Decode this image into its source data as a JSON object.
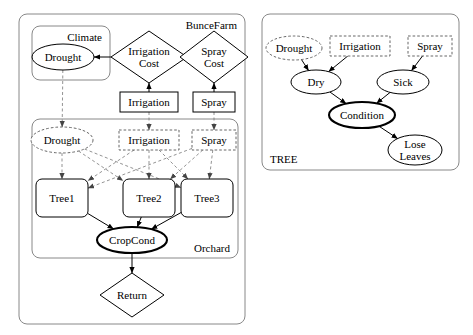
{
  "diagram": {
    "type": "object-oriented-bayesian-network",
    "panels": [
      {
        "id": "buncefarm",
        "label": "BunceFarm",
        "label_position": "top-right",
        "box": {
          "x": 19,
          "y": 14,
          "w": 226,
          "h": 310,
          "style": "solid-rounded"
        }
      },
      {
        "id": "tree-class",
        "label": "TREE",
        "label_position": "bottom-left",
        "box": {
          "x": 262,
          "y": 14,
          "w": 197,
          "h": 156,
          "style": "solid-rounded"
        }
      },
      {
        "id": "climate",
        "label": "Climate",
        "label_position": "top-right",
        "box": {
          "x": 32,
          "y": 26,
          "w": 78,
          "h": 54,
          "style": "solid-rounded"
        }
      },
      {
        "id": "orchard",
        "label": "Orchard",
        "label_position": "bottom-right",
        "box": {
          "x": 32,
          "y": 119,
          "w": 206,
          "h": 139,
          "style": "solid-rounded"
        }
      }
    ],
    "nodes": [
      {
        "id": "climate-drought",
        "label": "Drought",
        "shape": "ellipse",
        "border": "solid",
        "thick": false,
        "cx": 63,
        "cy": 57,
        "rx": 31,
        "ry": 13
      },
      {
        "id": "irrigation-cost",
        "label": "Irrigation\nCost",
        "shape": "diamond",
        "border": "solid",
        "thick": false,
        "cx": 149,
        "cy": 57,
        "rx": 38,
        "ry": 26
      },
      {
        "id": "spray-cost",
        "label": "Spray\nCost",
        "shape": "diamond",
        "border": "solid",
        "thick": false,
        "cx": 214,
        "cy": 57,
        "rx": 34,
        "ry": 26
      },
      {
        "id": "irrigation-box",
        "label": "Irrigation",
        "shape": "rect",
        "border": "solid",
        "thick": false,
        "cx": 149,
        "cy": 102,
        "rx": 29,
        "ry": 10
      },
      {
        "id": "spray-box",
        "label": "Spray",
        "shape": "rect",
        "border": "solid",
        "thick": false,
        "cx": 214,
        "cy": 102,
        "rx": 21,
        "ry": 10
      },
      {
        "id": "orchard-drought",
        "label": "Drought",
        "shape": "ellipse",
        "border": "dashed",
        "thick": false,
        "cx": 62,
        "cy": 140,
        "rx": 31,
        "ry": 13
      },
      {
        "id": "orchard-irrigation",
        "label": "Irrigation",
        "shape": "rect",
        "border": "dashed",
        "thick": false,
        "cx": 149,
        "cy": 140,
        "rx": 30,
        "ry": 10
      },
      {
        "id": "orchard-spray",
        "label": "Spray",
        "shape": "rect",
        "border": "dashed",
        "thick": false,
        "cx": 214,
        "cy": 140,
        "rx": 22,
        "ry": 10
      },
      {
        "id": "tree1",
        "label": "Tree1",
        "shape": "roundrect",
        "border": "solid",
        "thick": false,
        "cx": 62,
        "cy": 198,
        "rx": 26,
        "ry": 19
      },
      {
        "id": "tree2",
        "label": "Tree2",
        "shape": "roundrect",
        "border": "solid",
        "thick": false,
        "cx": 149,
        "cy": 198,
        "rx": 26,
        "ry": 19
      },
      {
        "id": "tree3",
        "label": "Tree3",
        "shape": "roundrect",
        "border": "solid",
        "thick": false,
        "cx": 207,
        "cy": 198,
        "rx": 26,
        "ry": 19
      },
      {
        "id": "cropcond",
        "label": "CropCond",
        "shape": "ellipse",
        "border": "solid",
        "thick": true,
        "cx": 132,
        "cy": 240,
        "rx": 35,
        "ry": 13
      },
      {
        "id": "return",
        "label": "Return",
        "shape": "diamond",
        "border": "solid",
        "thick": false,
        "cx": 132,
        "cy": 295,
        "rx": 32,
        "ry": 22
      },
      {
        "id": "t-drought",
        "label": "Drought",
        "shape": "ellipse",
        "border": "dashed",
        "thick": false,
        "cx": 294,
        "cy": 48,
        "rx": 28,
        "ry": 12
      },
      {
        "id": "t-irrigation",
        "label": "Irrigation",
        "shape": "rect",
        "border": "dashed",
        "thick": false,
        "cx": 360,
        "cy": 46,
        "rx": 30,
        "ry": 10
      },
      {
        "id": "t-spray",
        "label": "Spray",
        "shape": "rect",
        "border": "dashed",
        "thick": false,
        "cx": 430,
        "cy": 46,
        "rx": 22,
        "ry": 10
      },
      {
        "id": "t-dry",
        "label": "Dry",
        "shape": "ellipse",
        "border": "solid",
        "thick": false,
        "cx": 316,
        "cy": 82,
        "rx": 25,
        "ry": 12
      },
      {
        "id": "t-sick",
        "label": "Sick",
        "shape": "ellipse",
        "border": "solid",
        "thick": false,
        "cx": 403,
        "cy": 82,
        "rx": 26,
        "ry": 12
      },
      {
        "id": "t-condition",
        "label": "Condition",
        "shape": "ellipse",
        "border": "solid",
        "thick": true,
        "cx": 362,
        "cy": 115,
        "rx": 33,
        "ry": 13
      },
      {
        "id": "t-loseleaves",
        "label": "Lose\nLeaves",
        "shape": "ellipse",
        "border": "solid",
        "thick": false,
        "cx": 415,
        "cy": 150,
        "rx": 27,
        "ry": 15
      }
    ],
    "edges": [
      {
        "from": "climate-drought",
        "to": "irrigation-cost",
        "style": "solid",
        "arrow": "reverse"
      },
      {
        "from": "irrigation-cost",
        "to": "irrigation-box",
        "style": "solid",
        "arrow": "reverse"
      },
      {
        "from": "spray-cost",
        "to": "spray-box",
        "style": "solid",
        "arrow": "reverse"
      },
      {
        "from": "climate-drought",
        "to": "orchard-drought",
        "style": "dashed",
        "arrow": "forward"
      },
      {
        "from": "irrigation-box",
        "to": "orchard-irrigation",
        "style": "dashed",
        "arrow": "forward"
      },
      {
        "from": "spray-box",
        "to": "orchard-spray",
        "style": "dashed",
        "arrow": "forward"
      },
      {
        "from": "orchard-drought",
        "to": "tree1",
        "style": "dashed",
        "arrow": "forward"
      },
      {
        "from": "orchard-drought",
        "to": "tree2",
        "style": "dashed",
        "arrow": "forward"
      },
      {
        "from": "orchard-drought",
        "to": "tree3",
        "style": "dashed",
        "arrow": "forward"
      },
      {
        "from": "orchard-irrigation",
        "to": "tree1",
        "style": "dashed",
        "arrow": "forward"
      },
      {
        "from": "orchard-irrigation",
        "to": "tree2",
        "style": "dashed",
        "arrow": "forward"
      },
      {
        "from": "orchard-irrigation",
        "to": "tree3",
        "style": "dashed",
        "arrow": "forward"
      },
      {
        "from": "orchard-spray",
        "to": "tree1",
        "style": "dashed",
        "arrow": "forward"
      },
      {
        "from": "orchard-spray",
        "to": "tree2",
        "style": "dashed",
        "arrow": "forward"
      },
      {
        "from": "orchard-spray",
        "to": "tree3",
        "style": "dashed",
        "arrow": "forward"
      },
      {
        "from": "tree1",
        "to": "cropcond",
        "style": "solid",
        "arrow": "forward"
      },
      {
        "from": "tree2",
        "to": "cropcond",
        "style": "solid",
        "arrow": "forward"
      },
      {
        "from": "tree3",
        "to": "cropcond",
        "style": "solid",
        "arrow": "forward"
      },
      {
        "from": "cropcond",
        "to": "return",
        "style": "solid",
        "arrow": "forward"
      },
      {
        "from": "t-drought",
        "to": "t-dry",
        "style": "solid",
        "arrow": "forward"
      },
      {
        "from": "t-irrigation",
        "to": "t-dry",
        "style": "solid",
        "arrow": "forward"
      },
      {
        "from": "t-spray",
        "to": "t-sick",
        "style": "solid",
        "arrow": "forward"
      },
      {
        "from": "t-dry",
        "to": "t-condition",
        "style": "solid",
        "arrow": "forward"
      },
      {
        "from": "t-sick",
        "to": "t-condition",
        "style": "solid",
        "arrow": "forward"
      },
      {
        "from": "t-condition",
        "to": "t-loseleaves",
        "style": "solid",
        "arrow": "forward"
      }
    ],
    "colors": {
      "stroke": "#000000",
      "dashed_stroke": "#777777",
      "background": "#ffffff",
      "panel_stroke": "#888888"
    }
  }
}
